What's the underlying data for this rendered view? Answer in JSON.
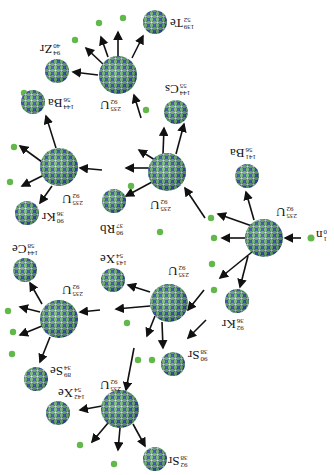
{
  "orientation": "rotated 180 degrees",
  "colors": {
    "nucleon_green": "#5fb84a",
    "nucleon_blue": "#2b3f9e",
    "neutron": "#62b84b",
    "arrow": "#111111"
  },
  "nuclei": [
    {
      "id": "n",
      "sym": "n",
      "mass": "1",
      "z": "0",
      "cx": 311,
      "cy": 238,
      "r": 3.5,
      "kind": "neutron",
      "lx": 316,
      "ly": 228
    },
    {
      "id": "u1",
      "sym": "U",
      "mass": "235",
      "z": "92",
      "cx": 264,
      "cy": 238,
      "r": 19,
      "kind": "nucleus",
      "lx": 276,
      "ly": 205
    },
    {
      "id": "ba141",
      "sym": "Ba",
      "mass": "141",
      "z": "56",
      "cx": 247,
      "cy": 176,
      "r": 12,
      "kind": "nucleus",
      "lx": 230,
      "ly": 146
    },
    {
      "id": "kr92",
      "sym": "Kr",
      "mass": "92",
      "z": "36",
      "cx": 237,
      "cy": 301,
      "r": 12,
      "kind": "nucleus",
      "lx": 222,
      "ly": 317
    },
    {
      "id": "u2",
      "sym": "U",
      "mass": "235",
      "z": "92",
      "cx": 167,
      "cy": 172,
      "r": 19,
      "kind": "nucleus",
      "lx": 150,
      "ly": 198
    },
    {
      "id": "cs144",
      "sym": "Cs",
      "mass": "144",
      "z": "55",
      "cx": 176,
      "cy": 112,
      "r": 12,
      "kind": "nucleus",
      "lx": 165,
      "ly": 82
    },
    {
      "id": "rb90",
      "sym": "Rb",
      "mass": "90",
      "z": "37",
      "cx": 114,
      "cy": 201,
      "r": 12,
      "kind": "nucleus",
      "lx": 100,
      "ly": 222
    },
    {
      "id": "u3",
      "sym": "U",
      "mass": "235",
      "z": "92",
      "cx": 118,
      "cy": 75,
      "r": 19,
      "kind": "nucleus",
      "lx": 100,
      "ly": 98
    },
    {
      "id": "zr94",
      "sym": "Zr",
      "mass": "94",
      "z": "40",
      "cx": 57,
      "cy": 71,
      "r": 12,
      "kind": "nucleus",
      "lx": 40,
      "ly": 42
    },
    {
      "id": "te139",
      "sym": "Te",
      "mass": "139",
      "z": "52",
      "cx": 155,
      "cy": 22,
      "r": 12,
      "kind": "nucleus",
      "lx": 170,
      "ly": 16
    },
    {
      "id": "ba144",
      "sym": "Ba",
      "mass": "144",
      "z": "56",
      "cx": 33,
      "cy": 102,
      "r": 12,
      "kind": "nucleus",
      "lx": 48,
      "ly": 96
    },
    {
      "id": "u4",
      "sym": "U",
      "mass": "235",
      "z": "92",
      "cx": 59,
      "cy": 167,
      "r": 19,
      "kind": "nucleus",
      "lx": 62,
      "ly": 192
    },
    {
      "id": "kr90",
      "sym": "Kr",
      "mass": "90",
      "z": "36",
      "cx": 27,
      "cy": 213,
      "r": 12,
      "kind": "nucleus",
      "lx": 42,
      "ly": 210
    },
    {
      "id": "u5",
      "sym": "U",
      "mass": "235",
      "z": "92",
      "cx": 169,
      "cy": 303,
      "r": 19,
      "kind": "nucleus",
      "lx": 168,
      "ly": 264
    },
    {
      "id": "xe143",
      "sym": "Xe",
      "mass": "143",
      "z": "54",
      "cx": 113,
      "cy": 280,
      "r": 12,
      "kind": "nucleus",
      "lx": 100,
      "ly": 252
    },
    {
      "id": "sr90",
      "sym": "Sr",
      "mass": "90",
      "z": "38",
      "cx": 173,
      "cy": 364,
      "r": 12,
      "kind": "nucleus",
      "lx": 188,
      "ly": 348
    },
    {
      "id": "u6",
      "sym": "U",
      "mass": "235",
      "z": "92",
      "cx": 59,
      "cy": 319,
      "r": 19,
      "kind": "nucleus",
      "lx": 62,
      "ly": 283
    },
    {
      "id": "ce144",
      "sym": "Ce",
      "mass": "144",
      "z": "58",
      "cx": 25,
      "cy": 270,
      "r": 12,
      "kind": "nucleus",
      "lx": 12,
      "ly": 242
    },
    {
      "id": "se89",
      "sym": "Se",
      "mass": "89",
      "z": "34",
      "cx": 36,
      "cy": 379,
      "r": 12,
      "kind": "nucleus",
      "lx": 50,
      "ly": 364
    },
    {
      "id": "xe142",
      "sym": "Xe",
      "mass": "142",
      "z": "54",
      "cx": 58,
      "cy": 413,
      "r": 12,
      "kind": "nucleus",
      "lx": 58,
      "ly": 386
    },
    {
      "id": "u7",
      "sym": "U",
      "mass": "235",
      "z": "92",
      "cx": 120,
      "cy": 409,
      "r": 19,
      "kind": "nucleus",
      "lx": 100,
      "ly": 378
    },
    {
      "id": "sr92",
      "sym": "Sr",
      "mass": "92",
      "z": "38",
      "cx": 155,
      "cy": 459,
      "r": 12,
      "kind": "nucleus",
      "lx": 168,
      "ly": 454
    }
  ],
  "neutrons": [
    [
      214,
      238
    ],
    [
      211,
      218
    ],
    [
      212,
      264
    ],
    [
      214,
      290
    ],
    [
      160,
      232
    ],
    [
      131,
      186
    ],
    [
      146,
      110
    ],
    [
      99,
      23
    ],
    [
      123,
      18
    ],
    [
      75,
      40
    ],
    [
      24,
      93
    ],
    [
      10,
      182
    ],
    [
      14,
      147
    ],
    [
      127,
      323
    ],
    [
      138,
      360
    ],
    [
      13,
      332
    ],
    [
      8,
      311
    ],
    [
      12,
      354
    ],
    [
      80,
      445
    ],
    [
      114,
      464
    ],
    [
      152,
      360
    ]
  ],
  "arrows": [
    [
      301,
      238,
      285,
      238
    ],
    [
      254,
      220,
      246,
      192
    ],
    [
      248,
      256,
      240,
      287
    ],
    [
      246,
      238,
      222,
      238
    ],
    [
      252,
      226,
      218,
      214
    ],
    [
      252,
      252,
      220,
      278
    ],
    [
      205,
      218,
      185,
      188
    ],
    [
      150,
      168,
      126,
      168
    ],
    [
      163,
      154,
      164,
      128
    ],
    [
      176,
      154,
      184,
      124
    ],
    [
      152,
      182,
      126,
      196
    ],
    [
      155,
      160,
      139,
      150
    ],
    [
      141,
      118,
      134,
      95
    ],
    [
      98,
      75,
      73,
      72
    ],
    [
      108,
      57,
      101,
      37
    ],
    [
      118,
      56,
      118,
      32
    ],
    [
      132,
      58,
      143,
      36
    ],
    [
      104,
      65,
      86,
      48
    ],
    [
      42,
      162,
      20,
      146
    ],
    [
      44,
      175,
      22,
      186
    ],
    [
      56,
      148,
      46,
      116
    ],
    [
      52,
      186,
      40,
      203
    ],
    [
      102,
      170,
      80,
      168
    ],
    [
      204,
      290,
      188,
      310
    ],
    [
      150,
      306,
      116,
      309
    ],
    [
      162,
      322,
      163,
      348
    ],
    [
      155,
      316,
      147,
      336
    ],
    [
      150,
      292,
      128,
      285
    ],
    [
      206,
      320,
      188,
      338
    ],
    [
      40,
      312,
      20,
      307
    ],
    [
      42,
      326,
      20,
      335
    ],
    [
      42,
      304,
      30,
      283
    ],
    [
      50,
      337,
      40,
      362
    ],
    [
      100,
      310,
      80,
      312
    ],
    [
      102,
      406,
      80,
      410
    ],
    [
      108,
      423,
      92,
      442
    ],
    [
      120,
      428,
      118,
      450
    ],
    [
      133,
      424,
      145,
      446
    ],
    [
      134,
      348,
      126,
      390
    ]
  ]
}
